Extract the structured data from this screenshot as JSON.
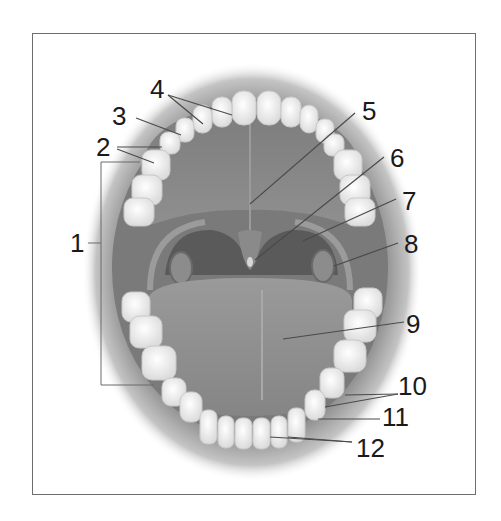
{
  "diagram": {
    "colors": {
      "frame": "#6d6d6d",
      "leader_line": "#4a4a4a",
      "lip_shadow": "#9a9a9a",
      "palate": "#8a8a8a",
      "throat": "#555555",
      "tongue": "#8e8e8e",
      "tooth": "#f4f4f4",
      "label_text": "#1a1a1a"
    },
    "labels": [
      {
        "id": "1",
        "text": "1",
        "x": 70,
        "y": 230
      },
      {
        "id": "2",
        "text": "2",
        "x": 96,
        "y": 134
      },
      {
        "id": "3",
        "text": "3",
        "x": 112,
        "y": 103
      },
      {
        "id": "4",
        "text": "4",
        "x": 150,
        "y": 76
      },
      {
        "id": "5",
        "text": "5",
        "x": 362,
        "y": 98
      },
      {
        "id": "6",
        "text": "6",
        "x": 390,
        "y": 145
      },
      {
        "id": "7",
        "text": "7",
        "x": 402,
        "y": 188
      },
      {
        "id": "8",
        "text": "8",
        "x": 404,
        "y": 231
      },
      {
        "id": "9",
        "text": "9",
        "x": 406,
        "y": 311
      },
      {
        "id": "10",
        "text": "10",
        "x": 398,
        "y": 373
      },
      {
        "id": "11",
        "text": "11",
        "x": 382,
        "y": 404
      },
      {
        "id": "12",
        "text": "12",
        "x": 356,
        "y": 435
      }
    ]
  }
}
